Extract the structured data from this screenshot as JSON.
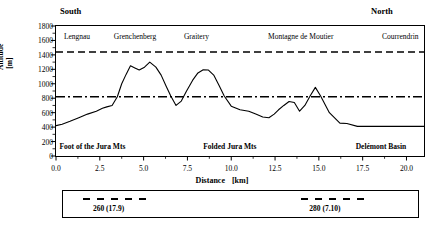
{
  "figure": {
    "orientation_left": "South",
    "orientation_right": "North"
  },
  "axes": {
    "y_title": "Altitude   [m]",
    "y_ticks": [
      0,
      200,
      400,
      600,
      800,
      1000,
      1200,
      1400,
      1600,
      1800
    ],
    "y_min": 0,
    "y_max": 1800,
    "x_title": "Distance",
    "x_unit": "[km]",
    "x_ticks": [
      "0.0",
      "2.5",
      "5.0",
      "7.5",
      "10.0",
      "12.5",
      "15.0",
      "17.5",
      "20.0"
    ],
    "x_min": 0,
    "x_max": 21,
    "x_tick_values": [
      0,
      2.5,
      5,
      7.5,
      10,
      12.5,
      15,
      17.5,
      20
    ]
  },
  "peak_labels": [
    {
      "name": "Lengnau",
      "x_km": 0.45
    },
    {
      "name": "Grenchenberg",
      "x_km": 3.3
    },
    {
      "name": "Graitery",
      "x_km": 7.3
    },
    {
      "name": "Montagne de Moutier",
      "x_km": 12.1
    },
    {
      "name": "Courrendrin",
      "x_km": 18.6
    }
  ],
  "zone_labels": [
    {
      "name": "Foot of the Jura Mts",
      "x_km": 0.2
    },
    {
      "name": "Folded Jura Mts",
      "x_km": 8.4
    },
    {
      "name": "Delémont Basin",
      "x_km": 17.1
    }
  ],
  "reference_lines": [
    {
      "altitude_m": 1440,
      "style": "dashed"
    },
    {
      "altitude_m": 820,
      "style": "dash-dot"
    }
  ],
  "legend": {
    "entries": [
      {
        "label": "260 (17.9)",
        "caption_x_km": 2.05,
        "dash_start_km": 1.5,
        "dash_end_km": 5.5
      },
      {
        "label": "280 (7.10)",
        "caption_x_km": 14.4,
        "dash_start_km": 13.9,
        "dash_end_km": 17.9
      }
    ]
  },
  "chart_data": {
    "type": "line",
    "title": "",
    "subtitle": "",
    "xlabel": "Distance   [km]",
    "ylabel": "Altitude   [m]",
    "xlim": [
      0,
      21
    ],
    "ylim": [
      0,
      1800
    ],
    "grid": false,
    "legend_position": "below-plot",
    "series": [
      {
        "name": "Topographic profile",
        "x": [
          0.0,
          0.35,
          0.8,
          1.3,
          1.8,
          2.3,
          2.65,
          2.9,
          3.2,
          3.5,
          3.75,
          4.0,
          4.25,
          4.5,
          4.75,
          5.05,
          5.35,
          5.7,
          6.0,
          6.3,
          6.55,
          6.85,
          7.15,
          7.45,
          7.8,
          8.1,
          8.4,
          8.7,
          9.0,
          9.3,
          9.6,
          10.0,
          10.5,
          11.0,
          11.4,
          11.8,
          12.15,
          12.45,
          12.7,
          13.0,
          13.3,
          13.6,
          13.9,
          14.2,
          14.5,
          14.8,
          15.1,
          15.6,
          16.2,
          16.6,
          17.2,
          18.5,
          20.0,
          21.0
        ],
        "y": [
          420,
          440,
          480,
          530,
          580,
          620,
          660,
          680,
          700,
          820,
          1000,
          1130,
          1250,
          1220,
          1190,
          1230,
          1300,
          1230,
          1120,
          960,
          830,
          700,
          760,
          900,
          1050,
          1150,
          1195,
          1190,
          1120,
          980,
          830,
          690,
          640,
          620,
          580,
          540,
          530,
          580,
          640,
          700,
          755,
          740,
          620,
          700,
          830,
          950,
          830,
          600,
          455,
          450,
          410,
          410,
          410,
          410
        ]
      }
    ],
    "reference_lines": [
      {
        "y": 1440,
        "style": "dashed",
        "label": ""
      },
      {
        "y": 820,
        "style": "dash-dot",
        "label": ""
      }
    ],
    "annotations": [
      {
        "text": "South",
        "position": "top-left-outside"
      },
      {
        "text": "North",
        "position": "top-right-outside"
      },
      {
        "text": "Lengnau",
        "x": 0.45,
        "y": 1640
      },
      {
        "text": "Grenchenberg",
        "x": 3.3,
        "y": 1640
      },
      {
        "text": "Graitery",
        "x": 7.3,
        "y": 1640
      },
      {
        "text": "Montagne de Moutier",
        "x": 12.1,
        "y": 1640
      },
      {
        "text": "Courrendrin",
        "x": 18.6,
        "y": 1640
      },
      {
        "text": "Foot of the Jura Mts",
        "x": 0.2,
        "y": 145
      },
      {
        "text": "Folded Jura Mts",
        "x": 8.4,
        "y": 145
      },
      {
        "text": "Delémont Basin",
        "x": 17.1,
        "y": 145
      }
    ]
  }
}
